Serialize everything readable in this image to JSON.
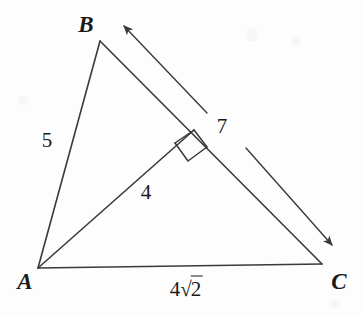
{
  "figure": {
    "kind": "geometry-diagram",
    "background_color": "#fdfdfd",
    "stroke_color": "#3a3a3a",
    "text_color": "#1a1a1a"
  },
  "vertices": [
    {
      "id": "A",
      "label": "A",
      "x": 38,
      "y": 268,
      "label_x": 25,
      "label_y": 281
    },
    {
      "id": "B",
      "label": "B",
      "x": 100,
      "y": 41,
      "label_x": 86,
      "label_y": 24
    },
    {
      "id": "C",
      "label": "C",
      "x": 322,
      "y": 264,
      "label_x": 339,
      "label_y": 281
    }
  ],
  "segments": [
    {
      "name": "side-ab",
      "from": "A",
      "to": "B",
      "x1": 38,
      "y1": 268,
      "x2": 100,
      "y2": 41
    },
    {
      "name": "side-bc",
      "from": "B",
      "to": "C",
      "x1": 100,
      "y1": 41,
      "x2": 322,
      "y2": 264
    },
    {
      "name": "side-ac",
      "from": "A",
      "to": "C",
      "x1": 38,
      "y1": 268,
      "x2": 322,
      "y2": 264
    },
    {
      "name": "altitude-a-to-bc",
      "from": "A",
      "to": "foot",
      "x1": 38,
      "y1": 268,
      "x2": 194,
      "y2": 130
    }
  ],
  "right_angle": {
    "name": "right-angle-marker",
    "at_x": 194,
    "at_y": 130,
    "corner_left_x": 175,
    "corner_left_y": 143,
    "corner_bottom_x": 188,
    "corner_bottom_y": 161,
    "corner_right_x": 207,
    "corner_right_y": 147
  },
  "arrows": [
    {
      "name": "arrow-toward-b",
      "x1": 207,
      "y1": 113,
      "x2": 122,
      "y2": 24,
      "direction": "up-left"
    },
    {
      "name": "arrow-toward-c",
      "x1": 246,
      "y1": 148,
      "x2": 334,
      "y2": 247,
      "direction": "down-right"
    }
  ],
  "measures": [
    {
      "name": "length-ab",
      "value": "5",
      "x": 47,
      "y": 140,
      "applies_to": "side-ab"
    },
    {
      "name": "length-altitude",
      "value": "4",
      "x": 146,
      "y": 192,
      "applies_to": "altitude-a-to-bc"
    },
    {
      "name": "length-bc",
      "value": "7",
      "x": 222,
      "y": 126,
      "applies_to": "side-bc"
    }
  ],
  "radical_measure": {
    "name": "length-ac",
    "coefficient": "4",
    "radical_sign": "√",
    "radicand": "2",
    "full_text": "4√2",
    "x": 186,
    "y": 289,
    "applies_to": "side-ac"
  }
}
